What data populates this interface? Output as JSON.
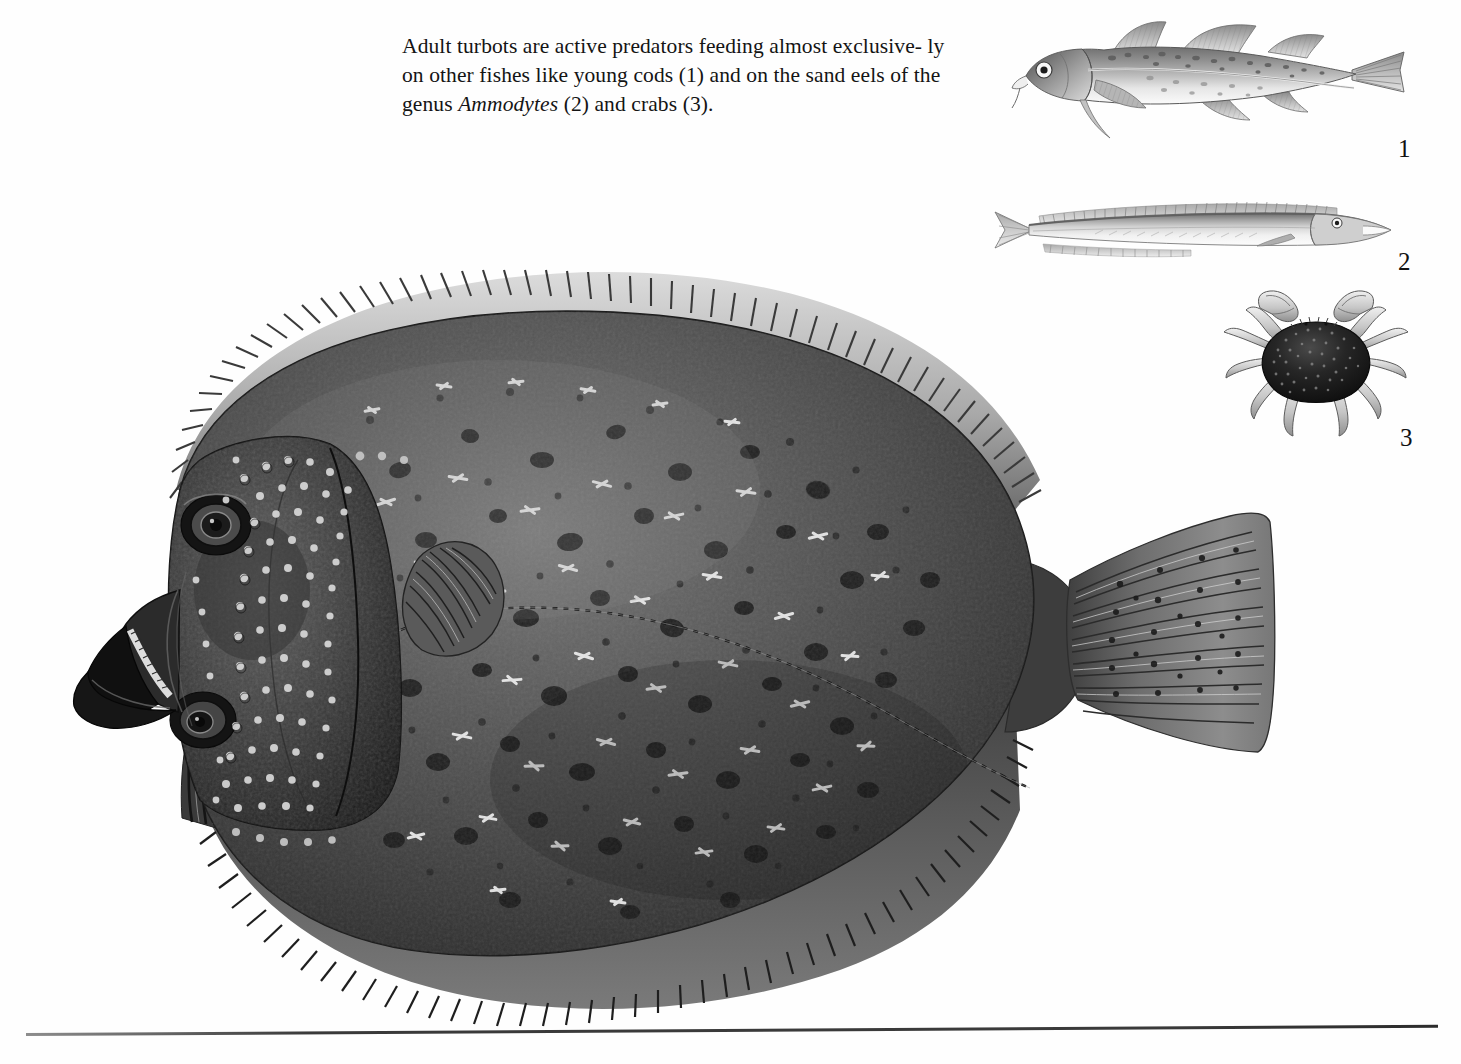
{
  "page": {
    "background_color": "#ffffff",
    "ink_color": "#141414",
    "bottom_rule_color": "#3a3a3a"
  },
  "caption": {
    "line1": "Adult turbots are active predators feeding almost exclusive-",
    "line2_a": "ly on other fishes like young cods (1) and on the sand eels of",
    "line3_a": "the genus ",
    "line3_italic": "Ammodytes",
    "line3_b": " (2) and crabs (3).",
    "full_text": "Adult turbots are active predators feeding almost exclusively on other fishes like young cods (1) and on the sand eels of the genus Ammodytes (2) and crabs (3)."
  },
  "labels": {
    "cod": "1",
    "sandeel": "2",
    "crab": "3"
  },
  "figures": {
    "turbot": {
      "name": "turbot",
      "common_name": "Turbot",
      "orientation": "head-left, eyed (left) side up",
      "body_tone": "#4a4a4a",
      "tubercle_highlight": "#e8e8e8",
      "blotch_tone": "#1d1d1d",
      "fin_tone": "#b9b9b9",
      "features": [
        "dorsal fin",
        "anal fin",
        "pectoral fin",
        "pelvic fin",
        "caudal fin",
        "lateral line",
        "upper eye",
        "lower eye",
        "open mouth",
        "bony tubercles"
      ]
    },
    "cod": {
      "name": "young-cod",
      "common_name": "Young cod",
      "orientation": "head-left",
      "body_tone": "#9a9a9a",
      "belly_tone": "#f2f2f2",
      "features": [
        "three dorsal fins",
        "two anal fins",
        "chin barbel",
        "pale lateral line",
        "mottled speckles"
      ]
    },
    "sandeel": {
      "name": "sand-eel",
      "common_name": "Sand eel",
      "genus": "Ammodytes",
      "orientation": "head-right",
      "body_tone": "#b0b0b0",
      "belly_tone": "#f4f4f4",
      "features": [
        "long single dorsal fin",
        "long anal fin",
        "forked tail",
        "pointed snout",
        "elongate body"
      ]
    },
    "crab": {
      "name": "crab",
      "common_name": "Crab",
      "orientation": "dorsal view",
      "carapace_tone": "#1c1c1c",
      "limb_tone": "#c9c9c9",
      "features": [
        "granular carapace",
        "two chelipeds",
        "four pairs of walking legs"
      ]
    }
  }
}
